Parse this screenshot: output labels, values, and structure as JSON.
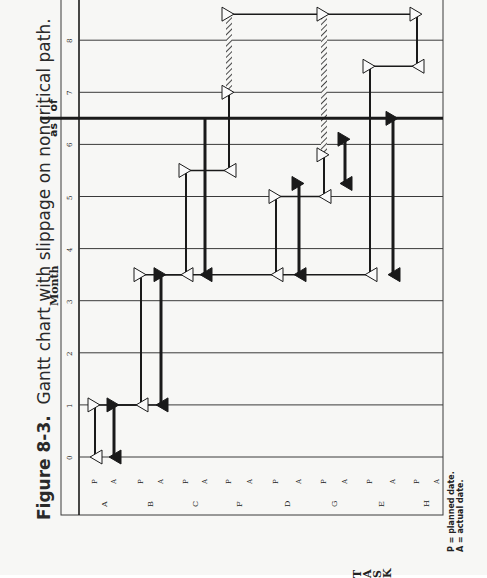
{
  "figure": {
    "number": "Figure 8-3.",
    "caption": "Gantt chart with slippage on noncritical path."
  },
  "axis": {
    "month_label": "Month",
    "task_label": "TASK",
    "as_of_label": [
      "as",
      "of"
    ]
  },
  "legend": {
    "planned": "P  =  planned date.",
    "actual": "A  =  actual date."
  },
  "colors": {
    "paper": "#f7f7f5",
    "ink": "#1a1a1a",
    "grid": "#3a3a3a"
  },
  "chart_data": {
    "type": "gantt",
    "orientation": "rotated 90° counter-clockwise (month axis vertical, tasks horizontal)",
    "xlabel": "TASK",
    "ylabel": "Month",
    "month_ticks": [
      0,
      1,
      2,
      3,
      4,
      5,
      6,
      7,
      8
    ],
    "month_range": [
      0,
      8.8
    ],
    "as_of_month": 6.5,
    "grid": true,
    "legend": [
      "P = planned date.",
      "A = actual date."
    ],
    "tasks": [
      "A",
      "B",
      "C",
      "F",
      "D",
      "G",
      "E",
      "H"
    ],
    "rows": [
      {
        "task": "A",
        "type": "P",
        "start": 0,
        "end": 1
      },
      {
        "task": "A",
        "type": "A",
        "start": 0,
        "end": 1
      },
      {
        "task": "B",
        "type": "P",
        "start": 1,
        "end": 3.5
      },
      {
        "task": "B",
        "type": "A",
        "start": 1,
        "end": 3.5
      },
      {
        "task": "C",
        "type": "P",
        "start": 3.5,
        "end": 5.5
      },
      {
        "task": "C",
        "type": "A",
        "start": 3.5,
        "end": 6.5,
        "in_progress": true
      },
      {
        "task": "F",
        "type": "P",
        "start": 5.5,
        "end": 7,
        "slipped_to": 8.5
      },
      {
        "task": "F",
        "type": "A",
        "start": null,
        "end": null
      },
      {
        "task": "D",
        "type": "P",
        "start": 3.5,
        "end": 5
      },
      {
        "task": "D",
        "type": "A",
        "start": 3.5,
        "end": 5.25
      },
      {
        "task": "G",
        "type": "P",
        "start": 5,
        "end": 5.8,
        "slipped_to": 8.5
      },
      {
        "task": "G",
        "type": "A",
        "start": 5.25,
        "end": 6.1
      },
      {
        "task": "E",
        "type": "P",
        "start": 3.5,
        "end": 7.5
      },
      {
        "task": "E",
        "type": "A",
        "start": 3.5,
        "end": 6.5,
        "in_progress": true
      },
      {
        "task": "H",
        "type": "P",
        "start": 7.5,
        "end": 8.5
      },
      {
        "task": "H",
        "type": "A",
        "start": null,
        "end": null
      }
    ],
    "dependencies": [
      {
        "from": "A-P",
        "to": "B-P",
        "at": 1
      },
      {
        "from": "A-A",
        "to": "B-A",
        "at": 1
      },
      {
        "from": "B-P",
        "to": "C-P",
        "at": 3.5
      },
      {
        "from": "B-A",
        "to": "E-P",
        "at": 3.5
      },
      {
        "from": "C-P",
        "to": "F-P",
        "at": 5.5
      },
      {
        "from": "D-P",
        "to": "G-P",
        "at": 5
      },
      {
        "from": "F-P(slipped)",
        "to": "H-P",
        "at": 8.5
      },
      {
        "from": "E-P",
        "to": "H-P",
        "at": 7.5
      }
    ]
  },
  "layout": {
    "row_x": [
      95,
      114,
      141,
      161,
      186,
      205,
      229,
      250,
      276,
      299,
      324,
      345,
      370,
      393,
      417,
      437
    ],
    "month_y0": 457,
    "month_px": 52.1
  }
}
